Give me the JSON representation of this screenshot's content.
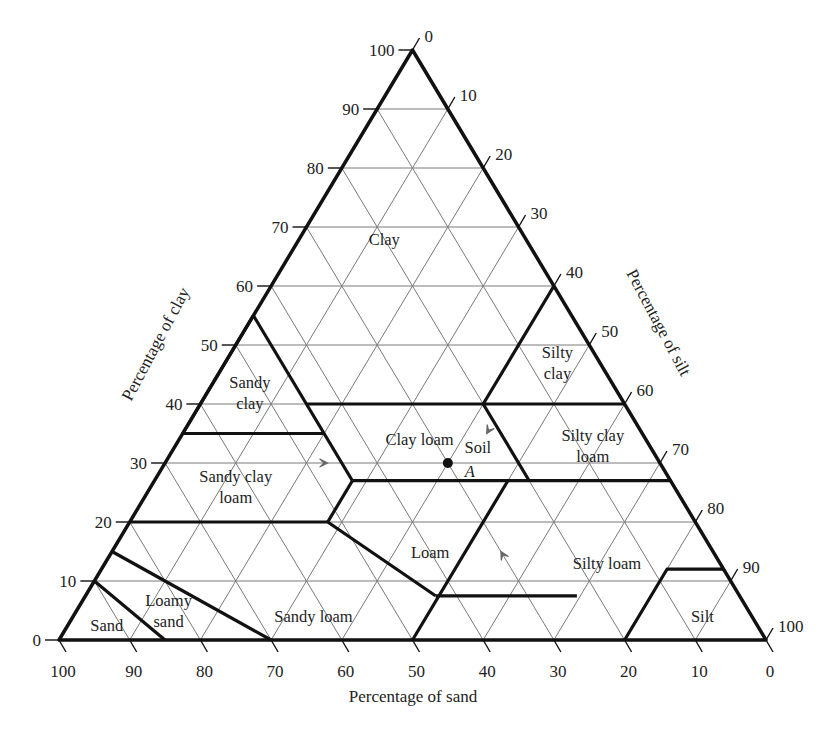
{
  "chart_data": {
    "type": "ternary",
    "axes": {
      "clay": {
        "label": "Percentage of clay",
        "ticks": [
          0,
          10,
          20,
          30,
          40,
          50,
          60,
          70,
          80,
          90,
          100
        ],
        "side": "left"
      },
      "silt": {
        "label": "Percentage of silt",
        "ticks": [
          0,
          10,
          20,
          30,
          40,
          50,
          60,
          70,
          80,
          90,
          100
        ],
        "side": "right"
      },
      "sand": {
        "label": "Percentage of sand",
        "ticks": [
          100,
          90,
          80,
          70,
          60,
          50,
          40,
          30,
          20,
          10,
          0
        ],
        "side": "bottom"
      }
    },
    "grid_step": 10,
    "regions": [
      {
        "name": "Clay",
        "label_lines": [
          "Clay"
        ],
        "label_at": {
          "sand": 20,
          "clay": 68
        }
      },
      {
        "name": "Sandy clay",
        "label_lines": [
          "Sandy",
          "clay"
        ],
        "label_at": {
          "sand": 52,
          "clay": 42
        }
      },
      {
        "name": "Silty clay",
        "label_lines": [
          "Silty",
          "clay"
        ],
        "label_at": {
          "sand": 6,
          "clay": 47
        }
      },
      {
        "name": "Clay loam",
        "label_lines": [
          "Clay loam"
        ],
        "label_at": {
          "sand": 32,
          "clay": 34
        }
      },
      {
        "name": "Silty clay loam",
        "label_lines": [
          "Silty clay",
          "loam"
        ],
        "label_at": {
          "sand": 8,
          "clay": 33
        }
      },
      {
        "name": "Sandy clay loam",
        "label_lines": [
          "Sandy clay",
          "loam"
        ],
        "label_at": {
          "sand": 62,
          "clay": 26
        }
      },
      {
        "name": "Loam",
        "label_lines": [
          "Loam"
        ],
        "label_at": {
          "sand": 40,
          "clay": 15
        }
      },
      {
        "name": "Silty loam",
        "label_lines": [
          "Silty loam"
        ],
        "label_at": {
          "sand": 16,
          "clay": 13
        }
      },
      {
        "name": "Sandy loam",
        "label_lines": [
          "Sandy loam"
        ],
        "label_at": {
          "sand": 62,
          "clay": 4
        }
      },
      {
        "name": "Loamy sand",
        "label_lines": [
          "Loamy",
          "sand"
        ],
        "label_at": {
          "sand": 82,
          "clay": 5
        }
      },
      {
        "name": "Sand",
        "label_lines": [
          "Sand"
        ],
        "label_at": {
          "sand": 92,
          "clay": 2.5
        }
      },
      {
        "name": "Silt",
        "label_lines": [
          "Silt"
        ],
        "label_at": {
          "sand": 7,
          "clay": 4
        }
      }
    ],
    "boundaries": [
      [
        [
          45,
          55
        ],
        [
          45,
          35
        ]
      ],
      [
        [
          65,
          35
        ],
        [
          45,
          35
        ]
      ],
      [
        [
          45,
          40
        ],
        [
          20,
          40
        ],
        [
          0,
          40
        ]
      ],
      [
        [
          20,
          40
        ],
        [
          0,
          60
        ]
      ],
      [
        [
          20,
          40
        ],
        [
          20,
          27
        ],
        [
          45,
          27
        ],
        [
          52,
          20
        ],
        [
          80,
          20
        ]
      ],
      [
        [
          45,
          35
        ],
        [
          45,
          27
        ]
      ],
      [
        [
          20,
          27
        ],
        [
          0,
          27
        ]
      ],
      [
        [
          45,
          27
        ],
        [
          52.5,
          20
        ]
      ],
      [
        [
          52,
          20
        ],
        [
          43,
          7.5
        ],
        [
          23,
          7.5
        ],
        [
          50,
          0
        ]
      ],
      [
        [
          23,
          7.5
        ],
        [
          20,
          12.5
        ],
        [
          8,
          12.5
        ],
        [
          0,
          12
        ]
      ],
      [
        [
          23,
          27
        ],
        [
          23,
          27
        ]
      ],
      [
        [
          50,
          0
        ],
        [
          23,
          27
        ]
      ],
      [
        [
          20,
          0
        ],
        [
          8,
          12
        ],
        [
          0,
          12
        ]
      ],
      [
        [
          85,
          15
        ],
        [
          70,
          0
        ]
      ],
      [
        [
          90,
          10
        ],
        [
          85,
          0
        ]
      ]
    ],
    "point": {
      "label": "Soil",
      "sublabel": "A",
      "sand": 30,
      "clay": 30,
      "silt": 40
    }
  },
  "labels": {
    "clay_axis": "Percentage of clay",
    "silt_axis": "Percentage of silt",
    "sand_axis": "Percentage of sand",
    "soil_point": "Soil",
    "soil_point_id": "A"
  }
}
